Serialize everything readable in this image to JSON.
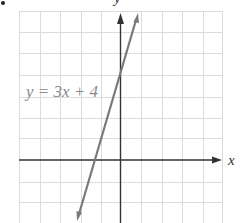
{
  "chart_data": {
    "type": "line",
    "title": "",
    "equation_label": "y = 3x + 4",
    "xlabel": "x",
    "ylabel": "y",
    "xlim": [
      -5,
      5
    ],
    "ylim": [
      -3,
      7
    ],
    "grid": true,
    "grid_step": 1,
    "legend": null,
    "series": [
      {
        "name": "y = 3x + 4",
        "slope": 3,
        "intercept": 4,
        "x": [
          -2.1,
          -1.3333,
          0,
          0.88
        ],
        "y": [
          -2.3,
          0,
          4,
          6.64
        ]
      }
    ],
    "annotations": [
      {
        "text": "y = 3x + 4",
        "position": "left of y-axis near y=4"
      }
    ]
  },
  "colors": {
    "grid": "#dcdcdc",
    "axes": "#333333",
    "line": "#7a7a7a",
    "label": "#8a8a8a"
  },
  "labels": {
    "x_axis": "x",
    "y_axis": "y",
    "equation": "y = 3x + 4"
  }
}
